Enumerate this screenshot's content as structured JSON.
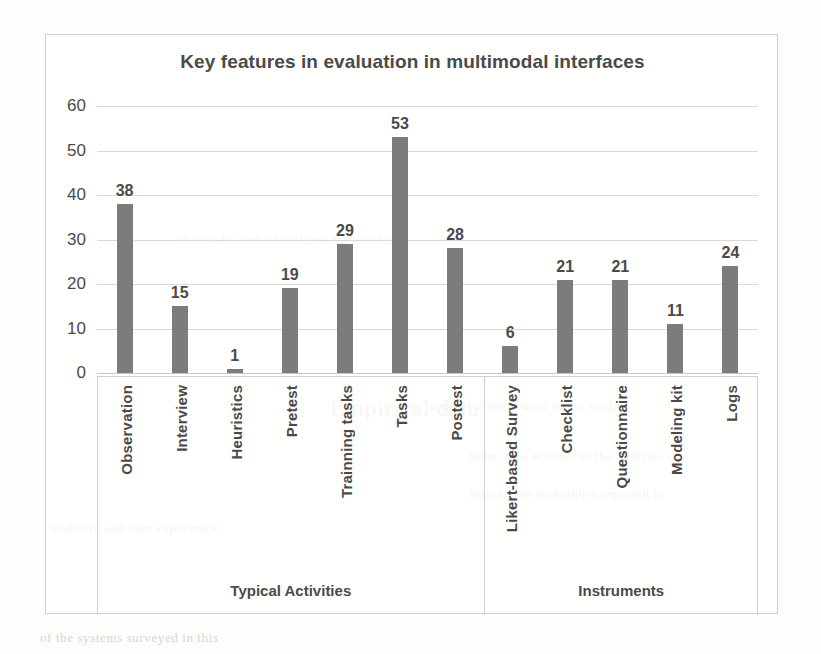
{
  "chart_data": {
    "type": "bar",
    "title": "Key features in evaluation in multimodal interfaces",
    "xlabel": "",
    "ylabel": "",
    "ylim": [
      0,
      60
    ],
    "yticks": [
      0,
      10,
      20,
      30,
      40,
      50,
      60
    ],
    "grid": true,
    "legend": "none",
    "orientation": "vertical",
    "bar_color": "#7c7c7c",
    "categories": [
      "Observation",
      "Interview",
      "Heuristics",
      "Pretest",
      "Trainning tasks",
      "Tasks",
      "Postest",
      "Likert-based Survey",
      "Checklist",
      "Questionnaire",
      "Modeling kit",
      "Logs"
    ],
    "values": [
      38,
      15,
      1,
      19,
      29,
      53,
      28,
      6,
      21,
      21,
      11,
      24
    ],
    "groups": [
      {
        "label": "Typical Activities",
        "start": 0,
        "end": 6
      },
      {
        "label": "Instruments",
        "start": 7,
        "end": 11
      }
    ]
  },
  "ghost_text": {
    "lines": [
      "the evaluation of multimodal interfaces",
      "a set of criteria used in the studies",
      "taken into account in the analysis of",
      "interaction techniques reported in",
      "Empirical data",
      "usability and user experience",
      "of the systems surveyed in this"
    ]
  }
}
